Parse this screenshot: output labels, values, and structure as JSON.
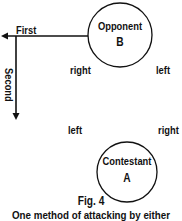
{
  "figure": {
    "number_label": "Fig. 4",
    "caption": "One method of attacking by either"
  },
  "opponent": {
    "name": "Opponent",
    "letter": "B",
    "side_right": "right",
    "side_left": "left"
  },
  "contestant": {
    "name": "Contestant",
    "letter": "A",
    "side_left": "left",
    "side_right": "right"
  },
  "arrows": {
    "first": "First",
    "second": "Second"
  },
  "colors": {
    "ink": "#111111",
    "background": "#ffffff"
  }
}
